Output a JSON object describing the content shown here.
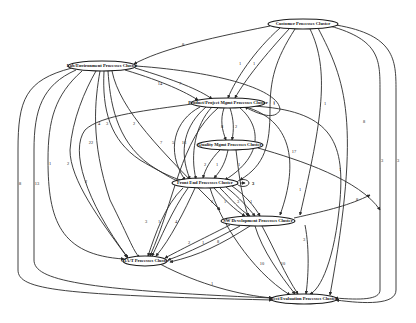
{
  "diagram": {
    "type": "directed-graph",
    "nodes": [
      {
        "id": "customer",
        "label": "Customer Processes Cluster",
        "x": 303,
        "y": 24,
        "rx": 35,
        "ry": 5
      },
      {
        "id": "lab",
        "label": "Lab/Environment Processes Cluster",
        "x": 102,
        "y": 66,
        "rx": 34,
        "ry": 5
      },
      {
        "id": "product",
        "label": "Product/Project Mgmt Processes Cluster",
        "x": 228,
        "y": 103,
        "rx": 37,
        "ry": 5
      },
      {
        "id": "quality",
        "label": "Quality Mgmt Processes Cluster",
        "x": 230,
        "y": 145,
        "rx": 33,
        "ry": 5
      },
      {
        "id": "frontend",
        "label": "Front End Processes Cluster",
        "x": 205,
        "y": 183,
        "rx": 33,
        "ry": 5
      },
      {
        "id": "swdev",
        "label": "SW Development Processes Cluster",
        "x": 258,
        "y": 221,
        "rx": 37,
        "ry": 5
      },
      {
        "id": "ciat",
        "label": "CIA/T Processes Cluster",
        "x": 145,
        "y": 261,
        "rx": 22,
        "ry": 5
      },
      {
        "id": "test",
        "label": "Test/Evaluation Processes Cluster",
        "x": 304,
        "y": 299,
        "rx": 33,
        "ry": 5
      }
    ],
    "edges": [
      {
        "d": "M270,26 C200,40 160,50 134,64",
        "label": "8",
        "lx": 183,
        "ly": 45
      },
      {
        "d": "M280,28 C255,50 235,80 228,98",
        "label": "1",
        "lx": 240,
        "ly": 64
      },
      {
        "d": "M290,28 C265,55 245,80 235,98",
        "label": "1",
        "lx": 254,
        "ly": 64
      },
      {
        "d": "M295,29 C275,60 270,80 270,110 C270,145 265,165 240,180",
        "label": "1",
        "lx": 274,
        "ly": 104
      },
      {
        "d": "M310,29 C330,70 322,120 300,215",
        "label": "1",
        "lx": 325,
        "ly": 104
      },
      {
        "d": "M318,28 C345,80 362,120 330,295",
        "label": "8",
        "lx": 364,
        "ly": 122
      },
      {
        "d": "M330,26 C380,40 380,60 380,90 L380,290 C380,300 360,300 335,298",
        "label": "3",
        "lx": 382,
        "ly": 161
      },
      {
        "d": "M336,25 C395,35 396,60 396,90 L396,290 C396,305 365,304 336,300",
        "label": "3",
        "lx": 398,
        "ly": 161
      },
      {
        "d": "M125,70 C165,82 185,92 198,100",
        "label": "14",
        "lx": 160,
        "ly": 84
      },
      {
        "d": "M135,68 C175,80 200,90 212,99",
        "label": "7",
        "lx": 180,
        "ly": 84
      },
      {
        "d": "M136,66 C220,72 280,90 280,110 C275,120 260,115 245,107",
        "label": "1",
        "lx": 274,
        "ly": 103
      },
      {
        "d": "M96,71 C85,90 72,120 70,150 C70,180 100,220 127,257",
        "label": "2",
        "lx": 68,
        "ly": 164
      },
      {
        "d": "M100,71 C95,100 90,140 110,200 C130,240 135,255 140,257",
        "label": "22",
        "lx": 91,
        "ly": 143
      },
      {
        "d": "M104,71 C102,110 110,140 140,160 C170,178 180,180 185,181",
        "label": "4",
        "lx": 99,
        "ly": 124
      },
      {
        "d": "M108,71 C110,100 115,140 150,165 C170,178 175,180 180,182",
        "label": "3",
        "lx": 107,
        "ly": 124
      },
      {
        "d": "M112,71 C120,110 160,150 220,210",
        "label": "2",
        "lx": 134,
        "ly": 124
      },
      {
        "d": "M72,68 C25,80 18,100 18,150 L18,270 C18,290 60,295 272,300",
        "label": "8",
        "lx": 20,
        "ly": 184
      },
      {
        "d": "M76,70 C42,85 34,110 34,150 L34,260 C34,280 80,290 272,298",
        "label": "13",
        "lx": 37,
        "ly": 184
      },
      {
        "d": "M82,71 C55,95 48,120 48,160 C48,220 60,255 124,259",
        "label": "1",
        "lx": 50,
        "ly": 164
      },
      {
        "d": "M192,104 C150,110 100,115 85,130 C70,150 85,200 128,258",
        "label": "2",
        "lx": 86,
        "ly": 182
      },
      {
        "d": "M200,107 C175,120 165,150 185,180",
        "label": "7",
        "lx": 161,
        "ly": 143
      },
      {
        "d": "M206,107 C185,125 178,150 190,179",
        "label": "5",
        "lx": 173,
        "ly": 143
      },
      {
        "d": "M212,107 C195,125 190,155 196,179",
        "label": "16",
        "lx": 184,
        "ly": 143
      },
      {
        "d": "M224,108 C220,120 222,130 226,140",
        "label": "8",
        "lx": 222,
        "ly": 127
      },
      {
        "d": "M230,108 C234,120 234,130 232,140",
        "label": "2",
        "lx": 236,
        "ly": 127
      },
      {
        "d": "M240,108 C260,125 265,155 225,180",
        "label": "8",
        "lx": 259,
        "ly": 145
      },
      {
        "d": "M246,107 C290,120 300,160 280,215",
        "label": "17",
        "lx": 294,
        "ly": 152
      },
      {
        "d": "M252,106 C330,110 345,140 340,200 C335,260 320,290 310,294",
        "label": "1",
        "lx": 340,
        "ly": 170
      },
      {
        "d": "M218,108 C180,140 175,200 150,256",
        "label": "",
        "lx": 0,
        "ly": 0
      },
      {
        "d": "M220,150 C210,160 205,170 203,178",
        "label": "2",
        "lx": 205,
        "ly": 165
      },
      {
        "d": "M228,150 C226,160 222,170 214,178",
        "label": "1",
        "lx": 217,
        "ly": 165
      },
      {
        "d": "M236,150 C238,165 240,190 248,216",
        "label": "1",
        "lx": 239,
        "ly": 165
      },
      {
        "d": "M258,148 C300,160 360,180 380,210",
        "label": "1",
        "lx": 300,
        "ly": 190
      },
      {
        "d": "M214,188 C225,200 235,210 245,216",
        "label": "3",
        "lx": 212,
        "ly": 202
      },
      {
        "d": "M220,188 C232,200 240,210 250,216",
        "label": "1",
        "lx": 225,
        "ly": 202
      },
      {
        "d": "M226,187 C240,198 248,208 255,216",
        "label": "3",
        "lx": 238,
        "ly": 202
      },
      {
        "d": "M232,186 C246,196 254,206 260,216",
        "label": "1",
        "lx": 251,
        "ly": 202
      },
      {
        "d": "M183,188 C165,205 155,235 148,256",
        "label": "3",
        "lx": 146,
        "ly": 222
      },
      {
        "d": "M188,188 C172,210 160,240 152,256",
        "label": "1",
        "lx": 159,
        "ly": 222
      },
      {
        "d": "M195,188 C185,210 170,240 156,256",
        "label": "4",
        "lx": 176,
        "ly": 222
      },
      {
        "d": "M210,188 C220,220 250,270 290,295",
        "label": "",
        "lx": 0,
        "ly": 0
      },
      {
        "d": "M240,183 L245,183",
        "label": "3",
        "lx": 253,
        "ly": 184
      },
      {
        "d": "M230,225 C200,240 180,250 165,258",
        "label": "2",
        "lx": 189,
        "ly": 243
      },
      {
        "d": "M240,226 C210,242 190,252 168,260",
        "label": "1",
        "lx": 203,
        "ly": 243
      },
      {
        "d": "M250,226 C220,245 200,255 170,262",
        "label": "8",
        "lx": 218,
        "ly": 242
      },
      {
        "d": "M262,226 C275,250 285,275 298,294",
        "label": "10",
        "lx": 283,
        "ly": 264
      },
      {
        "d": "M255,226 C262,250 280,275 295,294",
        "label": "10",
        "lx": 262,
        "ly": 264
      },
      {
        "d": "M294,218 C330,210 350,205 370,195",
        "label": "8",
        "lx": 357,
        "ly": 200
      },
      {
        "d": "M160,264 C200,285 240,295 272,298",
        "label": "1",
        "lx": 212,
        "ly": 284
      },
      {
        "d": "M305,225 C310,250 308,280 306,294",
        "label": "3",
        "lx": 304,
        "ly": 240
      }
    ],
    "self_loop": {
      "node": "frontend",
      "label": "3"
    }
  }
}
